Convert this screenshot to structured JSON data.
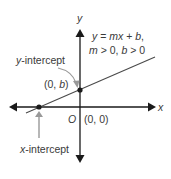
{
  "diagram": {
    "type": "coordinate-plane-line",
    "axes": {
      "x_label": "x",
      "y_label": "y",
      "origin_label": "O",
      "origin_coords": "(0, 0)"
    },
    "equation": {
      "line1": "y = mx + b,",
      "line2": "m > 0, b > 0"
    },
    "y_intercept": {
      "label": "y-intercept",
      "coords": "(0, b)"
    },
    "x_intercept": {
      "label": "x-intercept"
    },
    "colors": {
      "axis": "#1a1a1a",
      "line": "#4a4a4a",
      "pointer_arrow": "#999999",
      "text": "#3a3a3a"
    }
  }
}
